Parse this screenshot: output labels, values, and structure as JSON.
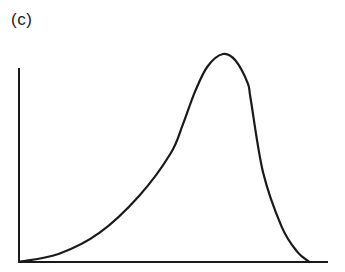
{
  "panel": {
    "label": "(c)"
  },
  "chart_data": {
    "type": "line",
    "title": "",
    "panel_label": "(c)",
    "xlabel": "",
    "ylabel": "",
    "x_ticks": [],
    "y_ticks": [],
    "grid": false,
    "legend": null,
    "xlim": [
      0,
      1
    ],
    "ylim": [
      0,
      1
    ],
    "series": [
      {
        "name": "curve",
        "x": [
          0.0,
          0.13,
          0.26,
          0.39,
          0.49,
          0.53,
          0.57,
          0.61,
          0.66,
          0.7,
          0.74,
          0.75,
          0.79,
          0.85,
          0.9,
          0.94
        ],
        "y": [
          0.0,
          0.04,
          0.14,
          0.32,
          0.52,
          0.66,
          0.82,
          0.94,
          1.0,
          0.97,
          0.86,
          0.78,
          0.43,
          0.17,
          0.05,
          0.0
        ]
      }
    ],
    "colors": {
      "line": "#1a1a1a",
      "background": "#ffffff"
    }
  }
}
